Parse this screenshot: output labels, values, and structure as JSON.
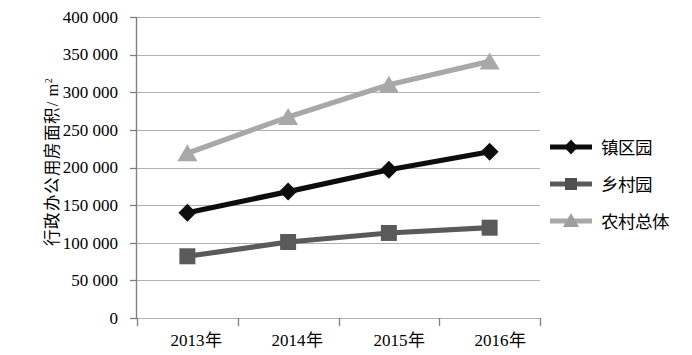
{
  "chart_data": {
    "type": "line",
    "title": "",
    "xlabel": "",
    "ylabel": "行政办公用房面积/ m",
    "ylabel_sup": "2",
    "categories": [
      "2013年",
      "2014年",
      "2015年",
      "2016年"
    ],
    "ylim": [
      0,
      400000
    ],
    "ytick_values": [
      0,
      50000,
      100000,
      150000,
      200000,
      250000,
      300000,
      350000,
      400000
    ],
    "ytick_labels": [
      "0",
      "50 000",
      "100 000",
      "150 000",
      "200 000",
      "250 000",
      "300 000",
      "350 000",
      "400 000"
    ],
    "grid": true,
    "legend_position": "right",
    "series": [
      {
        "name": "镇区园",
        "marker": "diamond",
        "color": "#0d0d0d",
        "values": [
          140000,
          168000,
          197000,
          221000
        ]
      },
      {
        "name": "乡村园",
        "marker": "square",
        "color": "#5a5a5a",
        "values": [
          82000,
          101000,
          113000,
          120000
        ]
      },
      {
        "name": "农村总体",
        "marker": "triangle",
        "color": "#a8a8a8",
        "values": [
          219000,
          267000,
          310000,
          341000
        ]
      }
    ]
  },
  "colors": {
    "axis": "#808080",
    "grid": "#b0b0b0",
    "background": "#ffffff"
  }
}
